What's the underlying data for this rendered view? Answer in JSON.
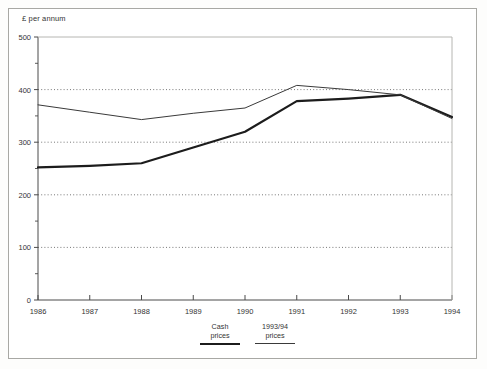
{
  "figure": {
    "axis_title": "£ per annum"
  },
  "legend": {
    "entries": [
      {
        "line1": "Cash",
        "line2": "prices",
        "style": "thick"
      },
      {
        "line1": "1993/94",
        "line2": "prices",
        "style": "thin"
      }
    ]
  },
  "chart_data": {
    "type": "line",
    "title": "",
    "subtitle": "",
    "xlabel": "",
    "ylabel": "£ per annum",
    "x": [
      1986,
      1987,
      1988,
      1989,
      1990,
      1991,
      1992,
      1993,
      1994
    ],
    "xtick_labels": [
      "1986",
      "1987",
      "1988",
      "1989",
      "1990",
      "1991",
      "1992",
      "1993",
      "1994"
    ],
    "ytick_labels": [
      "0",
      "100",
      "200",
      "300",
      "400",
      "500"
    ],
    "yticks": [
      0,
      100,
      200,
      300,
      400,
      500
    ],
    "yminor_ticks": [
      50,
      150,
      250,
      350,
      450
    ],
    "ylim": [
      0,
      500
    ],
    "xlim": [
      1986,
      1994
    ],
    "gridlines": [
      100,
      200,
      300,
      400
    ],
    "grid": "horizontal-dotted",
    "legend_position": "below-axis-center",
    "series": [
      {
        "name": "Cash prices",
        "style": "thick",
        "color": "#1c1c1c",
        "values": [
          252,
          255,
          260,
          290,
          320,
          378,
          383,
          390,
          348
        ]
      },
      {
        "name": "1993/94 prices",
        "style": "thin",
        "color": "#3a3a3a",
        "values": [
          371,
          357,
          343,
          355,
          365,
          408,
          400,
          390,
          345
        ]
      }
    ]
  }
}
